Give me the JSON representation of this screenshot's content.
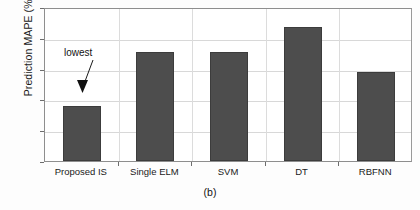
{
  "chart_data": {
    "type": "bar",
    "title": "",
    "subtitle": "",
    "xlabel": "",
    "ylabel": "Prediction MAPE (%)",
    "categories": [
      "Proposed IS",
      "Single ELM",
      "SVM",
      "DT",
      "RBFNN"
    ],
    "values": [
      1.8,
      3.55,
      3.55,
      4.35,
      2.9
    ],
    "ylim": [
      0,
      5
    ],
    "yticks": [
      0,
      1,
      2,
      3,
      4,
      5
    ],
    "ytick_labels": [
      "0",
      "1",
      "2",
      "3",
      "4",
      "5"
    ],
    "grid": "horizontal-and-vertical",
    "legend": "none",
    "bar_color": "#4d4d4d",
    "annotations": [
      {
        "text": "lowest",
        "target_category": "Proposed IS",
        "style": "arrow-pointing-down-to-first-bar"
      }
    ]
  },
  "caption": {
    "label": "(b)"
  },
  "axis": {
    "y_title": "Prediction MAPE (%)"
  }
}
